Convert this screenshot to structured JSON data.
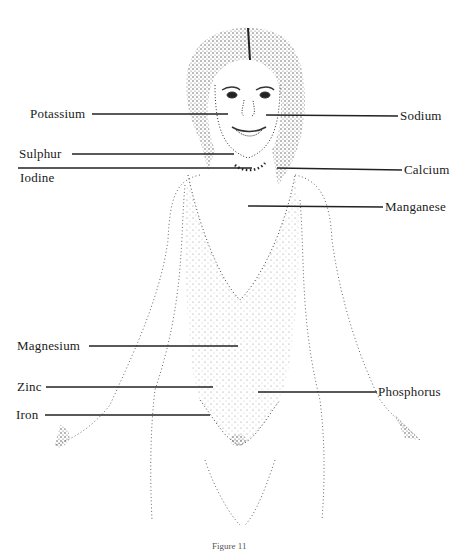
{
  "figure": {
    "caption": "Figure 11",
    "line_color": "#222222",
    "stipple_color": "#555555"
  },
  "labels": {
    "left": [
      {
        "id": "potassium",
        "text": "Potassium"
      },
      {
        "id": "sulphur",
        "text": "Sulphur"
      },
      {
        "id": "iodine",
        "text": "Iodine"
      },
      {
        "id": "magnesium",
        "text": "Magnesium"
      },
      {
        "id": "zinc",
        "text": "Zinc"
      },
      {
        "id": "iron",
        "text": "Iron"
      }
    ],
    "right": [
      {
        "id": "sodium",
        "text": "Sodium"
      },
      {
        "id": "calcium",
        "text": "Calcium"
      },
      {
        "id": "manganese",
        "text": "Manganese"
      },
      {
        "id": "phosphorus",
        "text": "Phosphorus"
      }
    ]
  }
}
